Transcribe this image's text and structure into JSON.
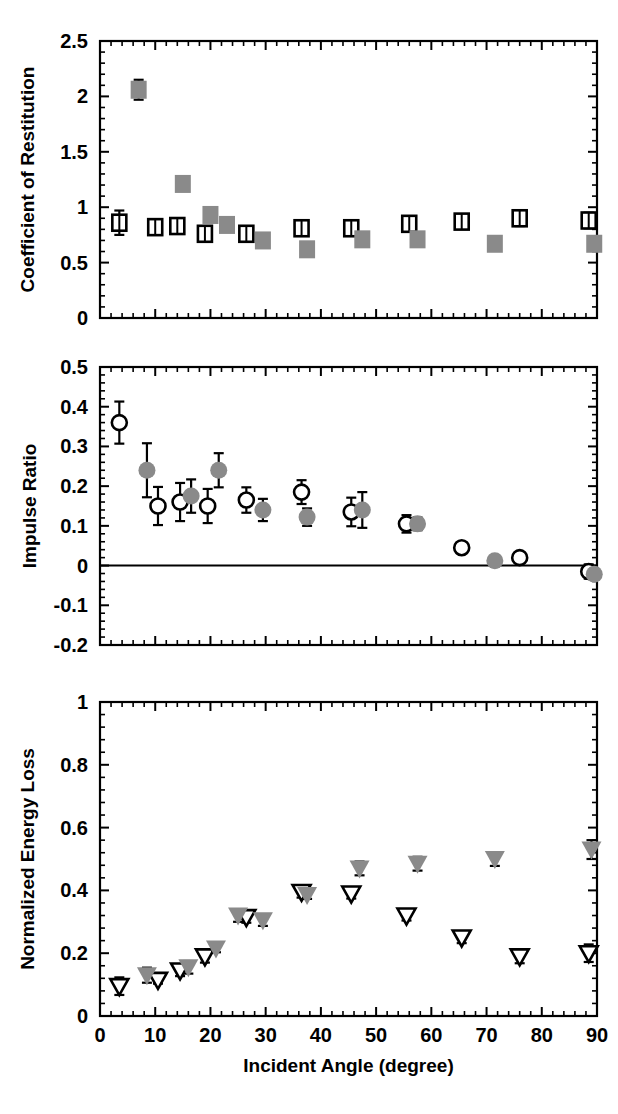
{
  "figure": {
    "background": "#ffffff",
    "ink": "#000000",
    "gray_marker": "#8a8a8a",
    "xlabel": "Incident Angle (degree)"
  },
  "chart_data": [
    {
      "type": "scatter",
      "panel": "top",
      "title": "",
      "xlabel": "",
      "ylabel": "Coefficient of Restitution",
      "xlim": [
        0,
        90
      ],
      "ylim": [
        0,
        2.5
      ],
      "xticks": [
        0,
        10,
        20,
        30,
        40,
        50,
        60,
        70,
        80,
        90
      ],
      "yticks": [
        0,
        0.5,
        1,
        1.5,
        2,
        2.5
      ],
      "yticklabels": [
        "0",
        "0.5",
        "1",
        "1.5",
        "2",
        "2.5"
      ],
      "minor_ticks_per_interval": 5,
      "grid": false,
      "legend": "none",
      "series": [
        {
          "name": "open-square",
          "marker": "open-square",
          "color": "#000000",
          "points": [
            {
              "x": 3.5,
              "y": 0.86,
              "yerr": 0.11
            },
            {
              "x": 10.0,
              "y": 0.82,
              "yerr": 0.04
            },
            {
              "x": 14.0,
              "y": 0.83,
              "yerr": 0.04
            },
            {
              "x": 19.0,
              "y": 0.76,
              "yerr": 0.04
            },
            {
              "x": 26.5,
              "y": 0.76,
              "yerr": 0.03
            },
            {
              "x": 36.5,
              "y": 0.81,
              "yerr": 0.04
            },
            {
              "x": 45.5,
              "y": 0.81,
              "yerr": 0.04
            },
            {
              "x": 56.0,
              "y": 0.85,
              "yerr": 0.05
            },
            {
              "x": 65.5,
              "y": 0.87,
              "yerr": 0.03
            },
            {
              "x": 76.0,
              "y": 0.9,
              "yerr": 0.07
            },
            {
              "x": 88.5,
              "y": 0.88,
              "yerr": 0.07
            }
          ]
        },
        {
          "name": "filled-square",
          "marker": "filled-square",
          "color": "#8a8a8a",
          "points": [
            {
              "x": 7.0,
              "y": 2.06,
              "yerr": 0.09
            },
            {
              "x": 15.0,
              "y": 1.21,
              "yerr": 0.04
            },
            {
              "x": 20.0,
              "y": 0.93,
              "yerr": 0.04
            },
            {
              "x": 23.0,
              "y": 0.84,
              "yerr": 0.0
            },
            {
              "x": 29.5,
              "y": 0.7,
              "yerr": 0.0
            },
            {
              "x": 37.5,
              "y": 0.62,
              "yerr": 0.0
            },
            {
              "x": 47.5,
              "y": 0.71,
              "yerr": 0.0
            },
            {
              "x": 57.5,
              "y": 0.71,
              "yerr": 0.0
            },
            {
              "x": 71.5,
              "y": 0.67,
              "yerr": 0.0
            },
            {
              "x": 89.5,
              "y": 0.67,
              "yerr": 0.0
            }
          ]
        }
      ]
    },
    {
      "type": "scatter",
      "panel": "middle",
      "title": "",
      "xlabel": "",
      "ylabel": "Impulse Ratio",
      "xlim": [
        0,
        90
      ],
      "ylim": [
        -0.2,
        0.5
      ],
      "xticks": [
        0,
        10,
        20,
        30,
        40,
        50,
        60,
        70,
        80,
        90
      ],
      "yticks": [
        -0.2,
        -0.1,
        0,
        0.1,
        0.2,
        0.3,
        0.4,
        0.5
      ],
      "yticklabels": [
        "-0.2",
        "-0.1",
        "0",
        "0.1",
        "0.2",
        "0.3",
        "0.4",
        "0.5"
      ],
      "minor_ticks_per_interval": 5,
      "grid": false,
      "zero_line": 0,
      "legend": "none",
      "series": [
        {
          "name": "open-circle",
          "marker": "open-circle",
          "color": "#000000",
          "points": [
            {
              "x": 3.5,
              "y": 0.36,
              "yerr": 0.053
            },
            {
              "x": 10.5,
              "y": 0.15,
              "yerr": 0.048
            },
            {
              "x": 14.5,
              "y": 0.16,
              "yerr": 0.048
            },
            {
              "x": 19.5,
              "y": 0.15,
              "yerr": 0.043
            },
            {
              "x": 26.5,
              "y": 0.165,
              "yerr": 0.032
            },
            {
              "x": 36.5,
              "y": 0.185,
              "yerr": 0.03
            },
            {
              "x": 45.5,
              "y": 0.135,
              "yerr": 0.036
            },
            {
              "x": 55.5,
              "y": 0.105,
              "yerr": 0.022
            },
            {
              "x": 65.5,
              "y": 0.045,
              "yerr": 0.014
            },
            {
              "x": 76.0,
              "y": 0.02,
              "yerr": 0.014
            },
            {
              "x": 88.5,
              "y": -0.015,
              "yerr": 0.018
            }
          ]
        },
        {
          "name": "filled-circle",
          "marker": "filled-circle",
          "color": "#8a8a8a",
          "points": [
            {
              "x": 8.5,
              "y": 0.24,
              "yerr": 0.068
            },
            {
              "x": 16.5,
              "y": 0.175,
              "yerr": 0.042
            },
            {
              "x": 21.5,
              "y": 0.24,
              "yerr": 0.043
            },
            {
              "x": 29.5,
              "y": 0.14,
              "yerr": 0.028
            },
            {
              "x": 37.5,
              "y": 0.122,
              "yerr": 0.022
            },
            {
              "x": 47.5,
              "y": 0.14,
              "yerr": 0.045
            },
            {
              "x": 57.5,
              "y": 0.105,
              "yerr": 0.016
            },
            {
              "x": 71.5,
              "y": 0.012,
              "yerr": 0.014
            },
            {
              "x": 89.5,
              "y": -0.022,
              "yerr": 0.014
            }
          ]
        }
      ]
    },
    {
      "type": "scatter",
      "panel": "bottom",
      "title": "",
      "xlabel": "Incident Angle (degree)",
      "ylabel": "Normalized Energy Loss",
      "xlim": [
        0,
        90
      ],
      "ylim": [
        0,
        1
      ],
      "xticks": [
        0,
        10,
        20,
        30,
        40,
        50,
        60,
        70,
        80,
        90
      ],
      "xticklabels": [
        "0",
        "10",
        "20",
        "30",
        "40",
        "50",
        "60",
        "70",
        "80",
        "90"
      ],
      "yticks": [
        0,
        0.2,
        0.4,
        0.6,
        0.8,
        1
      ],
      "yticklabels": [
        "0",
        "0.2",
        "0.4",
        "0.6",
        "0.8",
        "1"
      ],
      "minor_ticks_per_interval": 5,
      "grid": false,
      "legend": "none",
      "series": [
        {
          "name": "open-triangle-down",
          "marker": "open-triangle",
          "color": "#000000",
          "points": [
            {
              "x": 3.5,
              "y": 0.095,
              "yerr": 0.028
            },
            {
              "x": 10.5,
              "y": 0.115,
              "yerr": 0.012
            },
            {
              "x": 14.5,
              "y": 0.145,
              "yerr": 0.018
            },
            {
              "x": 19.0,
              "y": 0.19,
              "yerr": 0.02
            },
            {
              "x": 26.5,
              "y": 0.315,
              "yerr": 0.018
            },
            {
              "x": 36.5,
              "y": 0.395,
              "yerr": 0.018
            },
            {
              "x": 45.5,
              "y": 0.39,
              "yerr": 0.016
            },
            {
              "x": 55.5,
              "y": 0.32,
              "yerr": 0.016
            },
            {
              "x": 65.5,
              "y": 0.25,
              "yerr": 0.018
            },
            {
              "x": 76.0,
              "y": 0.19,
              "yerr": 0.022
            },
            {
              "x": 88.5,
              "y": 0.2,
              "yerr": 0.028
            }
          ]
        },
        {
          "name": "filled-triangle-down",
          "marker": "filled-triangle",
          "color": "#8a8a8a",
          "points": [
            {
              "x": 8.5,
              "y": 0.13,
              "yerr": 0.024
            },
            {
              "x": 16.0,
              "y": 0.155,
              "yerr": 0.02
            },
            {
              "x": 21.0,
              "y": 0.215,
              "yerr": 0.012
            },
            {
              "x": 25.0,
              "y": 0.32,
              "yerr": 0.02
            },
            {
              "x": 29.5,
              "y": 0.305,
              "yerr": 0.018
            },
            {
              "x": 37.5,
              "y": 0.385,
              "yerr": 0.012
            },
            {
              "x": 47.0,
              "y": 0.47,
              "yerr": 0.022
            },
            {
              "x": 57.5,
              "y": 0.485,
              "yerr": 0.022
            },
            {
              "x": 71.5,
              "y": 0.5,
              "yerr": 0.022
            },
            {
              "x": 89.0,
              "y": 0.53,
              "yerr": 0.03
            }
          ]
        }
      ]
    }
  ]
}
